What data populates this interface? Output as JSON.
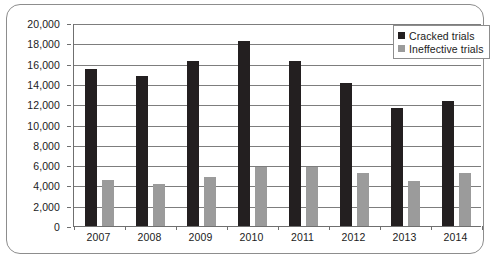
{
  "chart_data": {
    "type": "bar",
    "title": "",
    "subtitle": "",
    "xlabel": "",
    "ylabel": "",
    "categories": [
      "2007",
      "2008",
      "2009",
      "2010",
      "2011",
      "2012",
      "2013",
      "2014"
    ],
    "series": [
      {
        "name": "Cracked trials",
        "color": "#231f20",
        "values": [
          15500,
          14750,
          16250,
          18200,
          16300,
          14100,
          11600,
          12300
        ]
      },
      {
        "name": "Ineffective trials",
        "color": "#9b9b9b",
        "values": [
          4500,
          4100,
          4800,
          5800,
          5800,
          5200,
          4400,
          5250
        ]
      }
    ],
    "ylim": [
      0,
      20000
    ],
    "ytick_step": 2000,
    "ytick_labels": [
      "0",
      "2,000",
      "4,000",
      "6,000",
      "8,000",
      "10,000",
      "12,000",
      "14,000",
      "16,000",
      "18,000",
      "20,000"
    ],
    "ytick_values": [
      0,
      2000,
      4000,
      6000,
      8000,
      10000,
      12000,
      14000,
      16000,
      18000,
      20000
    ],
    "grid": true,
    "grid_axis": "y",
    "legend_position": "top-right",
    "legend_entries": [
      "Cracked trials",
      "Ineffective trials"
    ]
  }
}
